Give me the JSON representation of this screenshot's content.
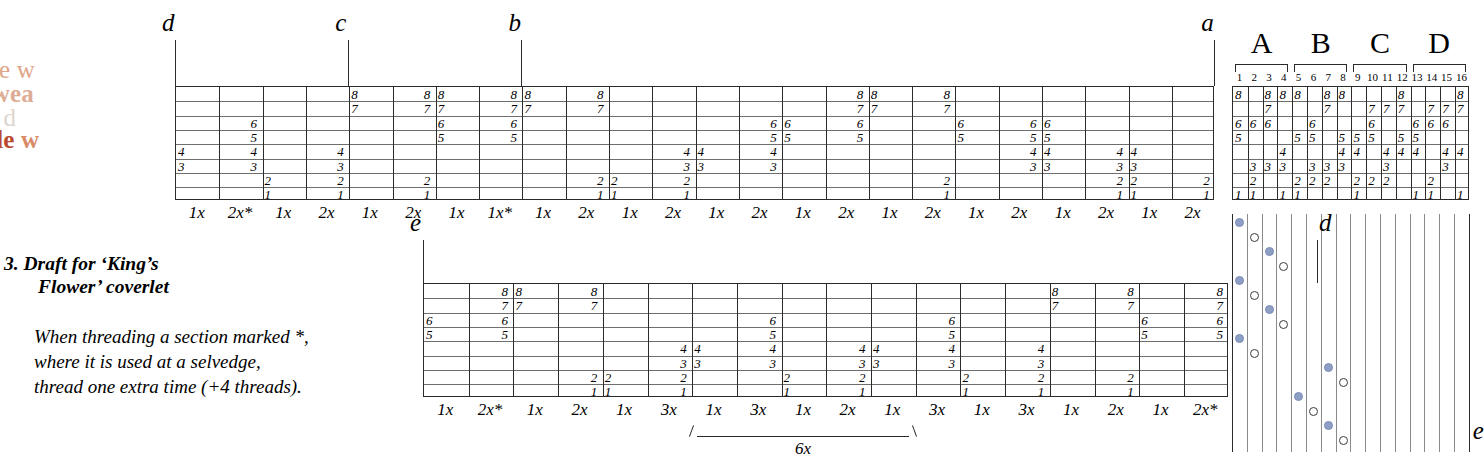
{
  "watermark": {
    "line1": "eave double w",
    "line2_bold": "e double ",
    "line2_pale": "wea",
    "line3": "uble weave d",
    "line4_bold": "ave double ",
    "line4_pale": "w"
  },
  "caption": {
    "title_line1": "3. Draft for ‘King’s",
    "title_line2": "Flower’ coverlet",
    "note_line1": "When threading a section marked *,",
    "note_line2": "where it is used at a selvedge,",
    "note_line3": "thread one extra time (+4 threads)."
  },
  "top_draft": {
    "shafts": [
      8,
      7,
      6,
      5,
      4,
      3,
      2,
      1
    ],
    "markers": [
      {
        "label": "d",
        "col": 0
      },
      {
        "label": "c",
        "col": 4
      },
      {
        "label": "b",
        "col": 8
      },
      {
        "label": "a",
        "col": 24
      }
    ],
    "repeats": [
      "1x",
      "2x*",
      "1x",
      "2x",
      "1x",
      "2x",
      "1x",
      "1x*",
      "1x",
      "2x",
      "1x",
      "2x",
      "1x",
      "2x",
      "1x",
      "2x",
      "1x",
      "2x",
      "1x",
      "2x",
      "1x",
      "2x",
      "1x",
      "2x"
    ],
    "cells": [
      {
        "col": 0,
        "shaft": 4
      },
      {
        "col": 0,
        "shaft": 3
      },
      {
        "col": 1,
        "shaft": 6
      },
      {
        "col": 1,
        "shaft": 5
      },
      {
        "col": 1,
        "shaft": 4
      },
      {
        "col": 1,
        "shaft": 3
      },
      {
        "col": 2,
        "shaft": 2
      },
      {
        "col": 2,
        "shaft": 1
      },
      {
        "col": 3,
        "shaft": 4
      },
      {
        "col": 3,
        "shaft": 3
      },
      {
        "col": 3,
        "shaft": 2
      },
      {
        "col": 3,
        "shaft": 1
      },
      {
        "col": 4,
        "shaft": 8
      },
      {
        "col": 4,
        "shaft": 7
      },
      {
        "col": 5,
        "shaft": 8
      },
      {
        "col": 5,
        "shaft": 7
      },
      {
        "col": 5,
        "shaft": 2
      },
      {
        "col": 5,
        "shaft": 1
      },
      {
        "col": 6,
        "shaft": 8
      },
      {
        "col": 6,
        "shaft": 7
      },
      {
        "col": 6,
        "shaft": 6
      },
      {
        "col": 6,
        "shaft": 5
      },
      {
        "col": 7,
        "shaft": 8
      },
      {
        "col": 7,
        "shaft": 7
      },
      {
        "col": 7,
        "shaft": 6
      },
      {
        "col": 7,
        "shaft": 5
      },
      {
        "col": 8,
        "shaft": 8
      },
      {
        "col": 8,
        "shaft": 7
      },
      {
        "col": 9,
        "shaft": 8
      },
      {
        "col": 9,
        "shaft": 7
      },
      {
        "col": 9,
        "shaft": 2
      },
      {
        "col": 9,
        "shaft": 1
      },
      {
        "col": 10,
        "shaft": 2
      },
      {
        "col": 10,
        "shaft": 1
      },
      {
        "col": 11,
        "shaft": 4
      },
      {
        "col": 11,
        "shaft": 3
      },
      {
        "col": 11,
        "shaft": 2
      },
      {
        "col": 11,
        "shaft": 1
      },
      {
        "col": 12,
        "shaft": 4
      },
      {
        "col": 12,
        "shaft": 3
      },
      {
        "col": 13,
        "shaft": 6
      },
      {
        "col": 13,
        "shaft": 5
      },
      {
        "col": 13,
        "shaft": 4
      },
      {
        "col": 13,
        "shaft": 3
      },
      {
        "col": 14,
        "shaft": 6
      },
      {
        "col": 14,
        "shaft": 5
      },
      {
        "col": 15,
        "shaft": 8
      },
      {
        "col": 15,
        "shaft": 7
      },
      {
        "col": 15,
        "shaft": 6
      },
      {
        "col": 15,
        "shaft": 5
      },
      {
        "col": 16,
        "shaft": 8
      },
      {
        "col": 16,
        "shaft": 7
      },
      {
        "col": 17,
        "shaft": 8
      },
      {
        "col": 17,
        "shaft": 7
      },
      {
        "col": 17,
        "shaft": 2
      },
      {
        "col": 17,
        "shaft": 1
      },
      {
        "col": 18,
        "shaft": 6
      },
      {
        "col": 18,
        "shaft": 5
      },
      {
        "col": 19,
        "shaft": 6
      },
      {
        "col": 19,
        "shaft": 5
      },
      {
        "col": 19,
        "shaft": 4
      },
      {
        "col": 19,
        "shaft": 3
      },
      {
        "col": 20,
        "shaft": 6
      },
      {
        "col": 20,
        "shaft": 5
      },
      {
        "col": 20,
        "shaft": 4
      },
      {
        "col": 20,
        "shaft": 3
      },
      {
        "col": 21,
        "shaft": 4
      },
      {
        "col": 21,
        "shaft": 3
      },
      {
        "col": 21,
        "shaft": 2
      },
      {
        "col": 21,
        "shaft": 1
      },
      {
        "col": 22,
        "shaft": 4
      },
      {
        "col": 22,
        "shaft": 3
      },
      {
        "col": 22,
        "shaft": 2
      },
      {
        "col": 22,
        "shaft": 1
      },
      {
        "col": 23,
        "shaft": 2
      },
      {
        "col": 23,
        "shaft": 1
      }
    ]
  },
  "tieup": {
    "groups": [
      "A",
      "B",
      "C",
      "D"
    ],
    "col_numbers": [
      "1",
      "2",
      "3",
      "4",
      "5",
      "6",
      "7",
      "8",
      "9",
      "10",
      "11",
      "12",
      "13",
      "14",
      "15",
      "16"
    ],
    "shafts": [
      8,
      7,
      6,
      5,
      4,
      3,
      2,
      1
    ],
    "columns": [
      {
        "n": 1,
        "marks": [
          8,
          6,
          5,
          1
        ]
      },
      {
        "n": 2,
        "marks": [
          6,
          3,
          2,
          1
        ]
      },
      {
        "n": 3,
        "marks": [
          8,
          7,
          6,
          3
        ]
      },
      {
        "n": 4,
        "marks": [
          8,
          4,
          3,
          1
        ]
      },
      {
        "n": 5,
        "marks": [
          8,
          5,
          2,
          1
        ]
      },
      {
        "n": 6,
        "marks": [
          6,
          5,
          3,
          2
        ]
      },
      {
        "n": 7,
        "marks": [
          8,
          7,
          3,
          2
        ]
      },
      {
        "n": 8,
        "marks": [
          8,
          5,
          4,
          3
        ]
      },
      {
        "n": 9,
        "marks": [
          5,
          4,
          2,
          1
        ]
      },
      {
        "n": 10,
        "marks": [
          7,
          6,
          5,
          2
        ]
      },
      {
        "n": 11,
        "marks": [
          7,
          4,
          3,
          2
        ]
      },
      {
        "n": 12,
        "marks": [
          8,
          7,
          5,
          4
        ]
      },
      {
        "n": 13,
        "marks": [
          6,
          5,
          4,
          1
        ]
      },
      {
        "n": 14,
        "marks": [
          7,
          6,
          2,
          1
        ]
      },
      {
        "n": 15,
        "marks": [
          7,
          6,
          4,
          3
        ]
      },
      {
        "n": 16,
        "marks": [
          8,
          7,
          4,
          1
        ]
      }
    ]
  },
  "treadling": {
    "marker_top": "a",
    "marker_bottom": "e",
    "picks": [
      {
        "col": 1,
        "type": "filled"
      },
      {
        "col": 2,
        "type": "open"
      },
      {
        "col": 3,
        "type": "filled"
      },
      {
        "col": 4,
        "type": "open"
      },
      {
        "col": 1,
        "type": "filled"
      },
      {
        "col": 2,
        "type": "open"
      },
      {
        "col": 3,
        "type": "filled"
      },
      {
        "col": 4,
        "type": "open"
      },
      {
        "col": 1,
        "type": "filled"
      },
      {
        "col": 2,
        "type": "open"
      },
      {
        "col": 7,
        "type": "filled"
      },
      {
        "col": 8,
        "type": "open"
      },
      {
        "col": 5,
        "type": "filled"
      },
      {
        "col": 6,
        "type": "open"
      },
      {
        "col": 7,
        "type": "filled"
      },
      {
        "col": 8,
        "type": "open"
      }
    ]
  },
  "bottom_draft": {
    "shafts": [
      8,
      7,
      6,
      5,
      4,
      3,
      2,
      1
    ],
    "markers": [
      {
        "label": "e",
        "col": 0,
        "side": "left"
      },
      {
        "label": "d",
        "col": 20,
        "side": "right"
      }
    ],
    "repeats": [
      "1x",
      "2x*",
      "1x",
      "2x",
      "1x",
      "3x",
      "1x",
      "3x",
      "1x",
      "2x",
      "1x",
      "3x",
      "1x",
      "3x",
      "1x",
      "2x",
      "1x",
      "2x*"
    ],
    "bracket": {
      "label": "6x",
      "from": 6,
      "to": 10
    },
    "cells": [
      {
        "col": 0,
        "shaft": 6
      },
      {
        "col": 0,
        "shaft": 5
      },
      {
        "col": 1,
        "shaft": 8
      },
      {
        "col": 1,
        "shaft": 7
      },
      {
        "col": 1,
        "shaft": 6
      },
      {
        "col": 1,
        "shaft": 5
      },
      {
        "col": 2,
        "shaft": 8
      },
      {
        "col": 2,
        "shaft": 7
      },
      {
        "col": 3,
        "shaft": 8
      },
      {
        "col": 3,
        "shaft": 7
      },
      {
        "col": 3,
        "shaft": 2
      },
      {
        "col": 3,
        "shaft": 1
      },
      {
        "col": 4,
        "shaft": 2
      },
      {
        "col": 4,
        "shaft": 1
      },
      {
        "col": 5,
        "shaft": 4
      },
      {
        "col": 5,
        "shaft": 3
      },
      {
        "col": 5,
        "shaft": 2
      },
      {
        "col": 5,
        "shaft": 1
      },
      {
        "col": 6,
        "shaft": 4
      },
      {
        "col": 6,
        "shaft": 3
      },
      {
        "col": 7,
        "shaft": 6
      },
      {
        "col": 7,
        "shaft": 5
      },
      {
        "col": 7,
        "shaft": 4
      },
      {
        "col": 7,
        "shaft": 3
      },
      {
        "col": 8,
        "shaft": 2
      },
      {
        "col": 8,
        "shaft": 1
      },
      {
        "col": 9,
        "shaft": 4
      },
      {
        "col": 9,
        "shaft": 3
      },
      {
        "col": 9,
        "shaft": 2
      },
      {
        "col": 9,
        "shaft": 1
      },
      {
        "col": 10,
        "shaft": 4
      },
      {
        "col": 10,
        "shaft": 3
      },
      {
        "col": 11,
        "shaft": 6
      },
      {
        "col": 11,
        "shaft": 5
      },
      {
        "col": 11,
        "shaft": 4
      },
      {
        "col": 11,
        "shaft": 3
      },
      {
        "col": 12,
        "shaft": 2
      },
      {
        "col": 12,
        "shaft": 1
      },
      {
        "col": 13,
        "shaft": 4
      },
      {
        "col": 13,
        "shaft": 3
      },
      {
        "col": 13,
        "shaft": 2
      },
      {
        "col": 13,
        "shaft": 1
      },
      {
        "col": 14,
        "shaft": 8
      },
      {
        "col": 14,
        "shaft": 7
      },
      {
        "col": 15,
        "shaft": 8
      },
      {
        "col": 15,
        "shaft": 7
      },
      {
        "col": 15,
        "shaft": 2
      },
      {
        "col": 15,
        "shaft": 1
      },
      {
        "col": 16,
        "shaft": 6
      },
      {
        "col": 16,
        "shaft": 5
      },
      {
        "col": 17,
        "shaft": 8
      },
      {
        "col": 17,
        "shaft": 7
      },
      {
        "col": 17,
        "shaft": 6
      },
      {
        "col": 17,
        "shaft": 5
      }
    ]
  }
}
